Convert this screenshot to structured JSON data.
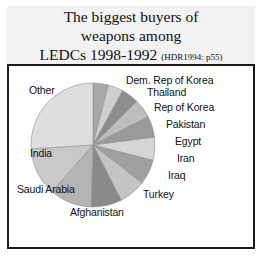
{
  "title": {
    "line1": "The biggest buyers of",
    "line2": "weapons among",
    "line3": "LEDCs 1998-1992",
    "source": "(HDR1994: p55)"
  },
  "chart_data": {
    "type": "pie",
    "title": "The biggest buyers of weapons among LEDCs 1998-1992 (HDR1994: p55)",
    "xlabel": "",
    "ylabel": "",
    "legend_position": "labels-around-pie",
    "grid": false,
    "start_angle_deg": -90,
    "direction": "clockwise",
    "categories": [
      "Dem. Rep of Korea",
      "Thailand",
      "Rep of Korea",
      "Pakistan",
      "Egypt",
      "Iran",
      "Iraq",
      "Turkey",
      "Afghanistan",
      "Saudi Arabia",
      "India",
      "Other"
    ],
    "values": [
      4.0,
      4.0,
      4.5,
      5.0,
      5.5,
      6.0,
      6.5,
      7.0,
      8.0,
      11.0,
      12.5,
      26.0
    ],
    "units": "percent",
    "colors": [
      "#a8a8a8",
      "#cfcfcf",
      "#8e8e8e",
      "#bdbdbd",
      "#9a9a9a",
      "#d6d6d6",
      "#a0a0a0",
      "#c4c4c4",
      "#8a8a8a",
      "#b4b4b4",
      "#c9c9c9",
      "#dedede"
    ],
    "slice_edge_color": "#8f8f8f"
  },
  "labels": {
    "other": "Other",
    "dem_rep_korea": "Dem. Rep of Korea",
    "thailand": "Thailand",
    "rep_of_korea": "Rep of Korea",
    "pakistan": "Pakistan",
    "egypt": "Egypt",
    "iran": "Iran",
    "iraq": "Iraq",
    "turkey": "Turkey",
    "afghanistan": "Afghanistan",
    "saudi_arabia": "Saudi Arabia",
    "india": "India"
  }
}
